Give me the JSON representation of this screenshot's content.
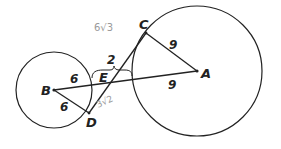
{
  "diagram": {
    "type": "geometry-two-circles-tangent-segments",
    "colors": {
      "ink": "#222222",
      "pencil": "#9a9a9a",
      "background": "#ffffff"
    },
    "points": {
      "A": {
        "label": "A",
        "x": 197,
        "y": 71
      },
      "B": {
        "label": "B",
        "x": 54,
        "y": 90
      },
      "C": {
        "label": "C",
        "x": 146,
        "y": 33
      },
      "D": {
        "label": "D",
        "x": 89,
        "y": 113
      },
      "E": {
        "label": "E",
        "x": 108,
        "y": 83
      }
    },
    "circles": [
      {
        "name": "circle-B",
        "center": "B",
        "r": 38
      },
      {
        "name": "circle-A",
        "center": "A",
        "r": 65
      }
    ],
    "segments": [
      {
        "name": "segment-BA",
        "from": "B",
        "to": "A"
      },
      {
        "name": "segment-BD",
        "from": "B",
        "to": "D"
      },
      {
        "name": "segment-AC",
        "from": "A",
        "to": "C"
      },
      {
        "name": "segment-DC",
        "from": "D",
        "to": "C"
      }
    ],
    "measures": {
      "BE_radius": "6",
      "BD_radius": "6",
      "AC_radius": "9",
      "AE_radius": "9",
      "gap_between_circles": "2"
    },
    "annotations": {
      "pencil_top": "6√3",
      "pencil_bottom": "3√2"
    }
  }
}
